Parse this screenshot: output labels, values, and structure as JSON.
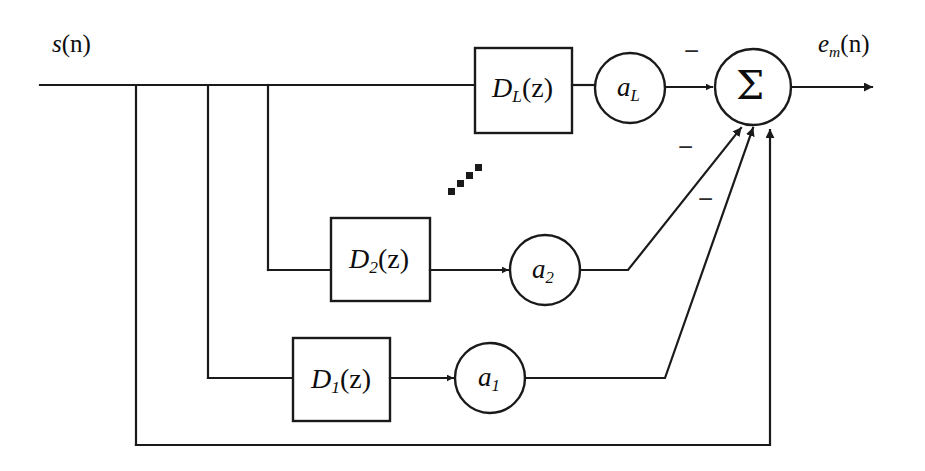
{
  "figure": {
    "type": "signal-flow-block-diagram",
    "background_color": "#ffffff",
    "line_color": "#1a1a1a"
  },
  "signals": {
    "input_label": "s(n)",
    "input_base": "s",
    "input_arg": "(n)",
    "output_label": "e_m(n)",
    "output_base": "e",
    "output_sub": "m",
    "output_arg": "(n)"
  },
  "blocks": [
    {
      "id": "D_L",
      "base": "D",
      "sub": "L",
      "arg": "(z)",
      "label": "D_L(z)"
    },
    {
      "id": "D_2",
      "base": "D",
      "sub": "2",
      "arg": "(z)",
      "label": "D_2(z)"
    },
    {
      "id": "D_1",
      "base": "D",
      "sub": "1",
      "arg": "(z)",
      "label": "D_1(z)"
    }
  ],
  "gains": [
    {
      "id": "a_L",
      "base": "a",
      "sub": "L",
      "label": "a_L"
    },
    {
      "id": "a_2",
      "base": "a",
      "sub": "2",
      "label": "a_2"
    },
    {
      "id": "a_1",
      "base": "a",
      "sub": "1",
      "label": "a_1"
    }
  ],
  "summation": {
    "symbol": "Σ",
    "name": "summing-junction",
    "sign_labels": [
      "−",
      "−",
      "−"
    ]
  },
  "ellipsis": {
    "symbol": "⋰",
    "dot_count": 4
  }
}
